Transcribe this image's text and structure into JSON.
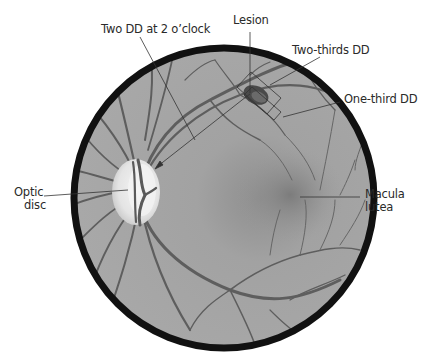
{
  "diagram": {
    "labels": {
      "two_dd": "Two DD at 2 o’clock",
      "lesion": "Lesion",
      "two_thirds_dd": "Two-thirds DD",
      "one_third_dd": "One-third DD",
      "optic_disc_line1": "Optic",
      "optic_disc_line2": "disc",
      "macula_line1": "Macula",
      "macula_line2": "lutea"
    },
    "colors": {
      "fundus_fill": "#9a9a9a",
      "fundus_rim": "#111111",
      "vessel": "#5a5a5a",
      "optic_disc": "#e6e6e6",
      "leader_line": "#333333",
      "background": "#ffffff"
    }
  }
}
